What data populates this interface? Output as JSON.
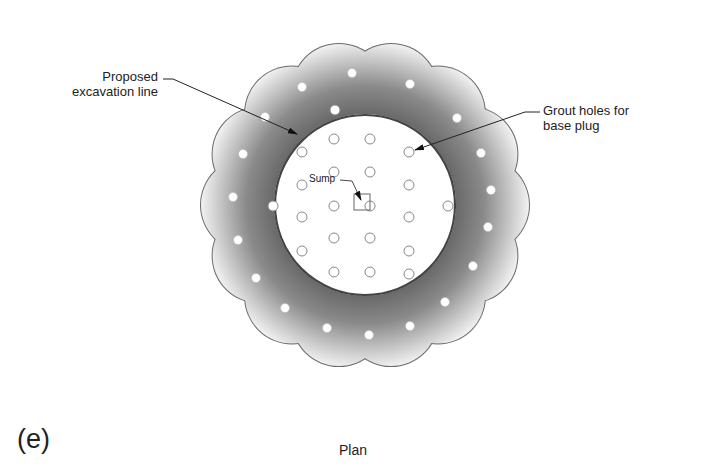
{
  "figure": {
    "panel_letter": "(e)",
    "caption": "Plan"
  },
  "labels": {
    "excavation": {
      "line1": "Proposed",
      "line2": "excavation line"
    },
    "grout_holes": {
      "line1": "Grout holes for",
      "line2": "base plug"
    },
    "sump": "Sump"
  },
  "colors": {
    "grout_dark": "#6e6e6e",
    "grout_light": "#f2f2f2",
    "outline": "#555555",
    "excavation_line": "#444444",
    "hole_outline": "#888888"
  },
  "geometry": {
    "center": [
      365,
      205
    ],
    "excavation_radius": 90,
    "scallop_count": 14,
    "scallop_ring_radius": 117,
    "scallop_radius": 47,
    "outer_holes": [
      [
        352,
        73
      ],
      [
        302,
        87
      ],
      [
        410,
        84
      ],
      [
        265,
        117
      ],
      [
        457,
        118
      ],
      [
        243,
        154
      ],
      [
        481,
        153
      ],
      [
        233,
        197
      ],
      [
        491,
        190
      ],
      [
        238,
        240
      ],
      [
        488,
        227
      ],
      [
        256,
        278
      ],
      [
        473,
        266
      ],
      [
        285,
        308
      ],
      [
        445,
        302
      ],
      [
        327,
        328
      ],
      [
        410,
        326
      ],
      [
        369,
        335
      ]
    ],
    "inner_holes": [
      [
        334,
        139
      ],
      [
        370,
        139
      ],
      [
        302,
        152
      ],
      [
        409,
        152
      ],
      [
        334,
        172
      ],
      [
        370,
        172
      ],
      [
        302,
        185
      ],
      [
        409,
        185
      ],
      [
        273,
        206
      ],
      [
        334,
        206
      ],
      [
        370,
        206
      ],
      [
        448,
        206
      ],
      [
        302,
        217
      ],
      [
        409,
        217
      ],
      [
        334,
        238
      ],
      [
        370,
        238
      ],
      [
        302,
        251
      ],
      [
        409,
        251
      ],
      [
        334,
        272
      ],
      [
        370,
        272
      ],
      [
        409,
        274
      ],
      [
        335,
        110
      ]
    ],
    "sump_box": [
      354,
      194,
      16,
      16
    ]
  }
}
